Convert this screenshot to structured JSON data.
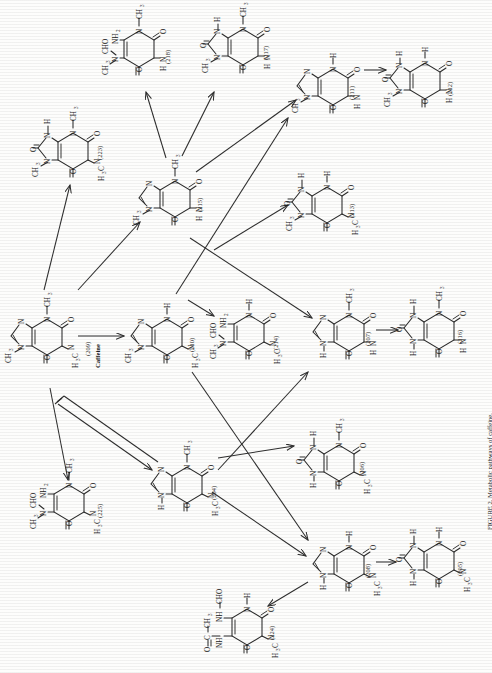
{
  "figure": {
    "caption": "FIGURE 2.  Metabolic pathways of caffeine.",
    "caffeine_word": "Caffeine",
    "orientation": "rotated-90-ccw",
    "ink_color": "#2b2b2b",
    "page_color": "#fdfdfc"
  },
  "compounds": [
    {
      "id": "218",
      "label": "(218)",
      "x": 118,
      "y": 18,
      "skeleton": "pyrimidine",
      "name": "1-methyl-5-acetylamino-6-amino-uracil-type",
      "substituents": {
        "top_left": "CH3",
        "top_left2": "CHO",
        "top_right": "NH2",
        "right": "CH3",
        "left": "O",
        "bottom_left": "H",
        "bottom": "O"
      }
    },
    {
      "id": "217",
      "label": "(217)",
      "x": 212,
      "y": 14,
      "skeleton": "purine-dione",
      "substituents": {
        "n1": "CH3",
        "n3": "H",
        "n7": "CH3",
        "o2": "O",
        "o4": "O",
        "o6": "O",
        "nh": "H"
      }
    },
    {
      "id": "211",
      "label": "(211)",
      "x": 300,
      "y": 52,
      "skeleton": "purine",
      "substituents": {
        "n1": "CH3",
        "n7": "H",
        "nh": "H",
        "o1": "O",
        "o2": "O"
      }
    },
    {
      "id": "212",
      "label": "(212)",
      "x": 390,
      "y": 46,
      "skeleton": "purine-dione",
      "substituents": {
        "n1": "CH3",
        "n3": "H",
        "n7": "H",
        "o": "O"
      }
    },
    {
      "id": "223",
      "label": "(223)",
      "x": 40,
      "y": 112,
      "skeleton": "purine-dione",
      "substituents": {
        "n1": "CH3",
        "n3": "H",
        "n7": "CH3",
        "n9": "H3C",
        "o": "O"
      }
    },
    {
      "id": "215",
      "label": "(215)",
      "x": 138,
      "y": 160,
      "skeleton": "purine",
      "substituents": {
        "n1": "CH3",
        "n7": "CH3",
        "nh": "H",
        "o": "O"
      }
    },
    {
      "id": "213",
      "label": "(213)",
      "x": 292,
      "y": 168,
      "skeleton": "purine-dione",
      "substituents": {
        "n1": "CH3",
        "n3": "H",
        "n7": "H",
        "n9": "H3C",
        "o": "O"
      }
    },
    {
      "id": "209",
      "label": "(209)",
      "x": 4,
      "y": 297,
      "skeleton": "purine",
      "is_caffeine": true,
      "substituents": {
        "n1": "CH3",
        "n7": "CH3",
        "n9": "H3C",
        "o": "O"
      }
    },
    {
      "id": "210",
      "label": "(210)",
      "x": 128,
      "y": 296,
      "skeleton": "purine",
      "substituents": {
        "n1": "CH3",
        "n7": "H",
        "n9": "H3C",
        "o": "O"
      }
    },
    {
      "id": "214",
      "label": "(214)",
      "x": 214,
      "y": 296,
      "skeleton": "pyrimidine",
      "substituents": {
        "top_left": "CH3",
        "top_left2": "CHO",
        "top_right": "NH2",
        "right": "H",
        "n9": "H3C",
        "o": "O"
      }
    },
    {
      "id": "207",
      "label": "(207)",
      "x": 312,
      "y": 292,
      "skeleton": "purine",
      "substituents": {
        "n1": "H",
        "n7": "CH3",
        "nh": "H",
        "o": "O"
      }
    },
    {
      "id": "216",
      "label": "(216)",
      "x": 402,
      "y": 290,
      "skeleton": "purine-dione",
      "substituents": {
        "n1": "H",
        "n3": "H",
        "n7": "CH3",
        "nh": "H",
        "o": "O"
      }
    },
    {
      "id": "206",
      "label": "(206)",
      "x": 300,
      "y": 424,
      "skeleton": "purine-dione",
      "substituents": {
        "n1": "H",
        "n3": "H",
        "n7": "CH3",
        "n9": "H3C",
        "o": "O"
      }
    },
    {
      "id": "225",
      "label": "(225)",
      "x": 36,
      "y": 466,
      "skeleton": "pyrimidine",
      "substituents": {
        "top_left": "CH3",
        "top_left2": "CHO",
        "top_right": "NH2",
        "right": "CH3",
        "n9": "H3C",
        "o": "O"
      }
    },
    {
      "id": "204",
      "label": "(204)",
      "x": 148,
      "y": 444,
      "skeleton": "purine",
      "substituents": {
        "n1": "H",
        "n7": "CH3",
        "n9": "H3C",
        "o": "O"
      }
    },
    {
      "id": "208",
      "label": "(208)",
      "x": 310,
      "y": 524,
      "skeleton": "purine",
      "substituents": {
        "n1": "H",
        "n7": "H",
        "n9": "H3C",
        "o": "O"
      }
    },
    {
      "id": "205",
      "label": "(205)",
      "x": 400,
      "y": 520,
      "skeleton": "purine-dione",
      "substituents": {
        "n1": "H",
        "n3": "H",
        "n7": "H",
        "n9": "H3C",
        "o": "O"
      }
    },
    {
      "id": "224",
      "label": "(224)",
      "x": 198,
      "y": 578,
      "skeleton": "pyrimidine",
      "substituents": {
        "top_left": "NH-C(=O)-CH3",
        "top_right": "NH-CHO",
        "right": "H",
        "n9": "H3C",
        "o": "O"
      }
    }
  ],
  "atoms": {
    "N": "N",
    "O": "O",
    "H": "H",
    "CH3": "CH3",
    "H3C": "H3C",
    "NH2": "NH2",
    "CHO": "CHO",
    "NH": "NH",
    "C": "C",
    "NH_CHO": "NH-CHO",
    "NH_CO": "NH-C-CH3"
  },
  "reactions": [
    {
      "from": "209",
      "to": "210",
      "type": "straight"
    },
    {
      "from": "209",
      "to": "223",
      "type": "straight"
    },
    {
      "from": "209",
      "to": "215",
      "type": "straight"
    },
    {
      "from": "209",
      "to": "225",
      "type": "straight"
    },
    {
      "from": "209",
      "to": "204",
      "type": "double-shaft"
    },
    {
      "from": "215",
      "to": "218",
      "type": "straight"
    },
    {
      "from": "215",
      "to": "217",
      "type": "straight"
    },
    {
      "from": "215",
      "to": "211",
      "type": "straight"
    },
    {
      "from": "215",
      "to": "207",
      "type": "straight"
    },
    {
      "from": "210",
      "to": "214",
      "type": "straight"
    },
    {
      "from": "210",
      "to": "211",
      "type": "straight"
    },
    {
      "from": "210",
      "to": "208",
      "type": "straight"
    },
    {
      "from": "210",
      "to": "213",
      "type": "straight"
    },
    {
      "from": "204",
      "to": "206",
      "type": "straight"
    },
    {
      "from": "204",
      "to": "207",
      "type": "straight"
    },
    {
      "from": "204",
      "to": "208",
      "type": "straight"
    },
    {
      "from": "211",
      "to": "212",
      "type": "straight"
    },
    {
      "from": "207",
      "to": "216",
      "type": "straight"
    },
    {
      "from": "208",
      "to": "205",
      "type": "straight"
    },
    {
      "from": "208",
      "to": "224",
      "type": "straight"
    }
  ]
}
